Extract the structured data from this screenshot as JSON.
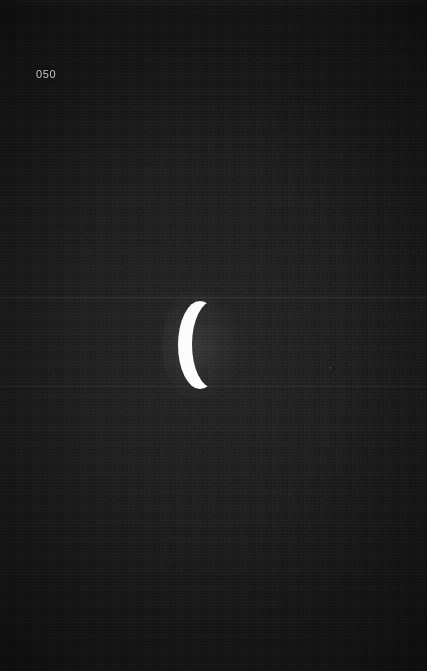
{
  "viewer": {
    "width": 427,
    "height": 671,
    "background_color": "#191919",
    "subject": "crescent-moon-night-sky"
  },
  "overlay": {
    "frame_label": "050",
    "frame_label_color": "#c9c9c9"
  },
  "moon": {
    "name": "waning-crescent-moon",
    "color": "#f7f7f5",
    "glow_color": "#ffffff",
    "center_x": 202,
    "center_y": 345,
    "width": 44,
    "height": 86,
    "opening_direction": "right"
  },
  "artifacts": {
    "scanlines": [
      {
        "y": 297,
        "opacity": 0.075
      },
      {
        "y": 386,
        "opacity": 0.065
      }
    ],
    "bands": [
      {
        "y": 0,
        "height": 6,
        "opacity": 0.03
      },
      {
        "y": 196,
        "height": 2,
        "opacity": 0.018
      },
      {
        "y": 430,
        "height": 2,
        "opacity": 0.014
      },
      {
        "y": 560,
        "height": 2,
        "opacity": 0.012
      }
    ]
  }
}
